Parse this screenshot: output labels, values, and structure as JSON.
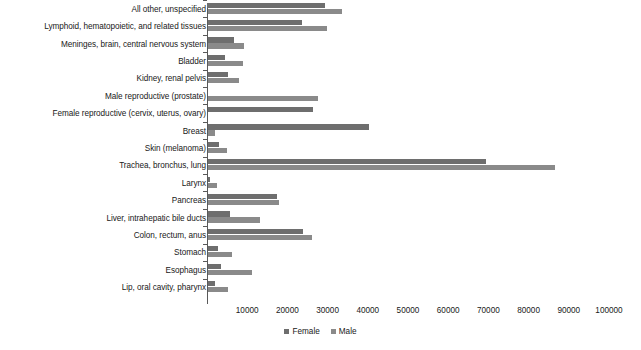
{
  "chart_data": {
    "type": "bar",
    "orientation": "horizontal",
    "title": "",
    "subtitle": "",
    "xlabel": "",
    "ylabel": "",
    "xlim": [
      0,
      100000
    ],
    "ylim": null,
    "grid": false,
    "legend_position": "bottom-center",
    "x_ticks": [
      10000,
      20000,
      30000,
      40000,
      50000,
      60000,
      70000,
      80000,
      90000,
      100000
    ],
    "x_tick_labels": [
      "10000",
      "20000",
      "30000",
      "40000",
      "50000",
      "60000",
      "70000",
      "80000",
      "90000",
      "100000"
    ],
    "categories": [
      "All other, unspecified",
      "Lymphoid, hematopoietic, and related tissues",
      "Meninges, brain, central nervous system",
      "Bladder",
      "Kidney, renal pelvis",
      "Male reproductive (prostate)",
      "Female reproductive (cervix, uterus, ovary)",
      "Breast",
      "Skin (melanoma)",
      "Trachea, bronchus, lung",
      "Larynx",
      "Pancreas",
      "Liver, intrahepatic bile ducts",
      "Colon, rectum, anus",
      "Stomach",
      "Esophagus",
      "Lip, oral cavity, pharynx"
    ],
    "series": [
      {
        "name": "Female",
        "color": "#6e6e6e",
        "values": [
          29400,
          23700,
          6800,
          4400,
          5100,
          0,
          26400,
          40200,
          3000,
          69300,
          800,
          17300,
          5700,
          24000,
          2800,
          3400,
          2100
        ]
      },
      {
        "name": "Male",
        "color": "#8a8a8a",
        "values": [
          33700,
          29800,
          9300,
          8900,
          7900,
          27500,
          0,
          2100,
          5000,
          86600,
          2500,
          18000,
          13200,
          26200,
          6300,
          11200,
          5300
        ]
      }
    ]
  },
  "legend": {
    "items": [
      {
        "label": "Female",
        "color": "#6e6e6e",
        "swatch_name": "legend-swatch-female"
      },
      {
        "label": "Male",
        "color": "#8a8a8a",
        "swatch_name": "legend-swatch-male"
      }
    ]
  },
  "colors": {
    "female": "#6e6e6e",
    "male": "#8a8a8a",
    "axis": "#595959",
    "text": "#202020",
    "background": "#ffffff"
  }
}
